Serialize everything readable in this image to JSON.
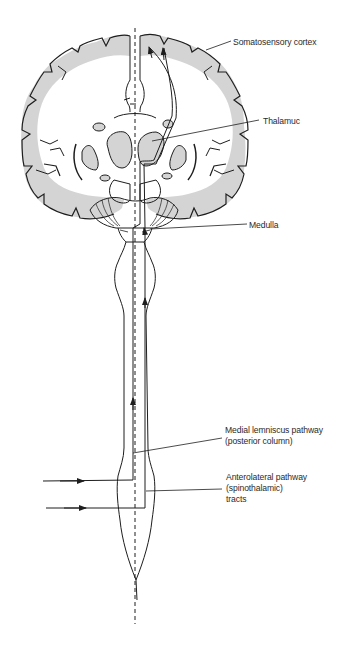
{
  "figure": {
    "type": "anatomical-diagram",
    "colors": {
      "line": "#1e1e1e",
      "gray_matter": "#d4d4d4",
      "background": "#ffffff"
    }
  },
  "labels": {
    "somatosensory_cortex": "Somatosensory cortex",
    "thalamus": "Thalamuc",
    "medulla": "Medulla",
    "medial_lemniscus": {
      "line1": "Medial lemniscus pathway",
      "line2": "(posterior column)"
    },
    "anterolateral": {
      "line1": "Anterolateral pathway",
      "line2": "(spinothalamic)",
      "line3": "tracts"
    }
  }
}
